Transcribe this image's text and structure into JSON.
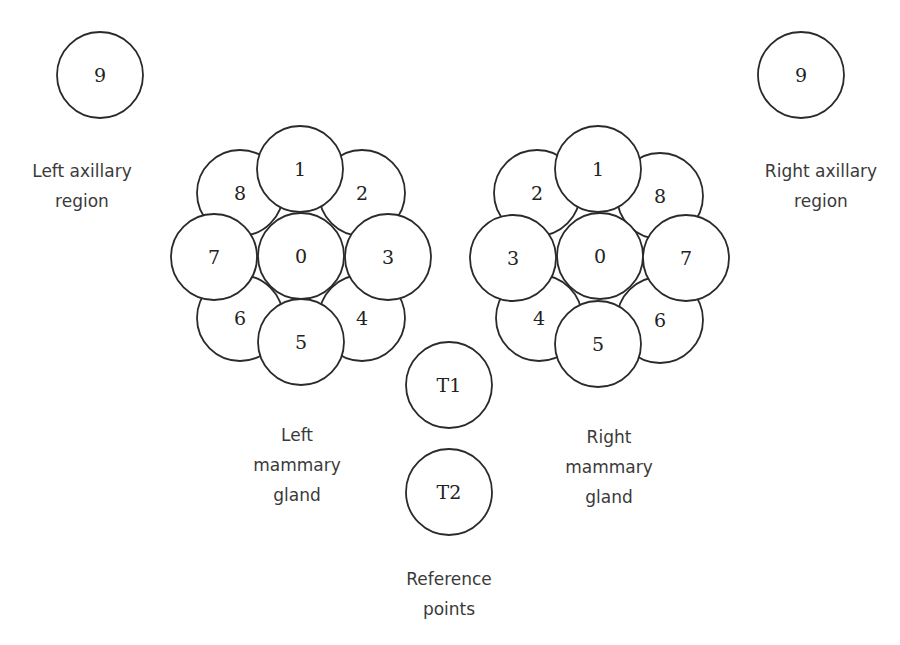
{
  "diagram": {
    "left_axillary": {
      "label": "9",
      "cx": 100,
      "cy": 75,
      "r": 43,
      "caption": [
        "Left axillary",
        "region"
      ]
    },
    "right_axillary": {
      "label": "9",
      "cx": 801,
      "cy": 75,
      "r": 43,
      "caption": [
        "Right axillary",
        "region"
      ]
    },
    "left_gland": {
      "caption": [
        "Left",
        "mammary",
        "gland"
      ],
      "back": [
        {
          "label": "8",
          "cx": 240,
          "cy": 193
        },
        {
          "label": "2",
          "cx": 362,
          "cy": 193
        },
        {
          "label": "4",
          "cx": 362,
          "cy": 318
        },
        {
          "label": "6",
          "cx": 240,
          "cy": 318
        }
      ],
      "center": {
        "label": "0",
        "cx": 301,
        "cy": 256
      },
      "front": [
        {
          "label": "1",
          "cx": 300,
          "cy": 169
        },
        {
          "label": "3",
          "cx": 388,
          "cy": 257
        },
        {
          "label": "5",
          "cx": 301,
          "cy": 342
        },
        {
          "label": "7",
          "cx": 214,
          "cy": 257
        }
      ]
    },
    "right_gland": {
      "caption": [
        "Right",
        "mammary",
        "gland"
      ],
      "back": [
        {
          "label": "2",
          "cx": 537,
          "cy": 193
        },
        {
          "label": "8",
          "cx": 660,
          "cy": 196
        },
        {
          "label": "6",
          "cx": 660,
          "cy": 320
        },
        {
          "label": "4",
          "cx": 539,
          "cy": 318
        }
      ],
      "center": {
        "label": "0",
        "cx": 600,
        "cy": 256
      },
      "front": [
        {
          "label": "1",
          "cx": 598,
          "cy": 169
        },
        {
          "label": "3",
          "cx": 513,
          "cy": 258
        },
        {
          "label": "5",
          "cx": 598,
          "cy": 344
        },
        {
          "label": "7",
          "cx": 686,
          "cy": 258
        }
      ]
    },
    "reference": {
      "caption": [
        "Reference",
        "points"
      ],
      "points": [
        {
          "label": "T1",
          "cx": 449,
          "cy": 385
        },
        {
          "label": "T2",
          "cx": 449,
          "cy": 492
        }
      ]
    },
    "radius": 43,
    "stroke_color": "#2a2a2a",
    "text_color": "#3a3a3a"
  }
}
